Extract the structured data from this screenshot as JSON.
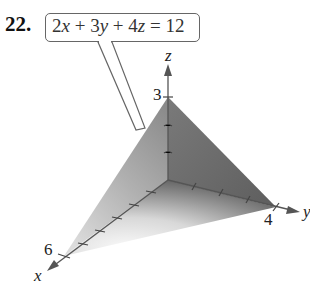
{
  "problem_number": "22.",
  "equation": {
    "text": "2x + 3y + 4z = 12",
    "parts": [
      "2",
      "x",
      " + 3",
      "y",
      " + 4",
      "z",
      " = 12"
    ]
  },
  "axes": {
    "x": {
      "label": "x",
      "intercept_label": "6",
      "ticks": 6
    },
    "y": {
      "label": "y",
      "intercept_label": "4",
      "ticks": 4
    },
    "z": {
      "label": "z",
      "intercept_label": "3",
      "ticks": 3
    }
  },
  "colors": {
    "plane_dark": "#6e6e6e",
    "plane_light": "#f2f2f2",
    "axis": "#555555"
  }
}
